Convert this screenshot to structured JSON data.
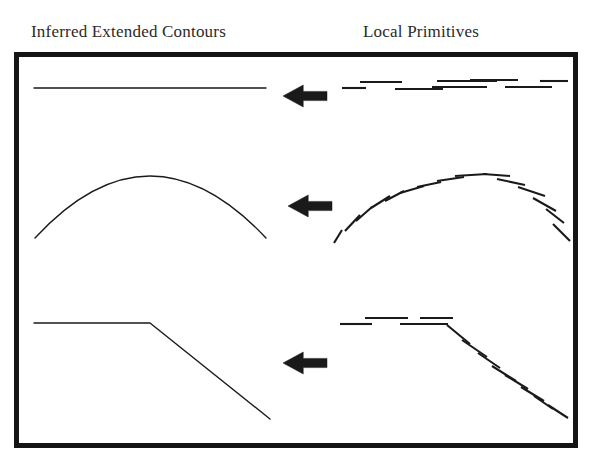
{
  "figure": {
    "title_left": "Inferred Extended Contours",
    "title_right": "Local Primitives",
    "frame_color": "#151515",
    "stroke_color": "#1a1a1a",
    "background": "#ffffff"
  },
  "diagram_data": {
    "type": "diagram",
    "description": "Three rows comparing inferred extended contours (left) with fragmented local primitives (right), joined by leftward arrows",
    "frame": {
      "x": 14,
      "y": 52,
      "width": 564,
      "height": 396,
      "border_width": 5
    },
    "rows": [
      {
        "name": "straight-line",
        "arrow": {
          "x": 283,
          "y": 85,
          "direction": "left",
          "width": 44,
          "height": 22
        },
        "inferred": {
          "kind": "polyline",
          "points": [
            [
              34,
              88
            ],
            [
              266,
              88
            ]
          ]
        },
        "primitives": {
          "kind": "segments",
          "segments": [
            [
              [
                342,
                88
              ],
              [
                366,
                88
              ]
            ],
            [
              [
                360,
                82
              ],
              [
                402,
                82
              ]
            ],
            [
              [
                395,
                89
              ],
              [
                443,
                89
              ]
            ],
            [
              [
                437,
                81
              ],
              [
                497,
                81
              ]
            ],
            [
              [
                432,
                87
              ],
              [
                487,
                87
              ]
            ],
            [
              [
                470,
                80
              ],
              [
                518,
                80
              ]
            ],
            [
              [
                505,
                87
              ],
              [
                552,
                87
              ]
            ],
            [
              [
                540,
                81
              ],
              [
                568,
                81
              ]
            ]
          ]
        }
      },
      {
        "name": "convex-arc",
        "arrow": {
          "x": 288,
          "y": 195,
          "direction": "left",
          "width": 44,
          "height": 22
        },
        "inferred": {
          "kind": "arc",
          "start": [
            35,
            238
          ],
          "peak": [
            150,
            176
          ],
          "end": [
            266,
            238
          ]
        },
        "primitives": {
          "kind": "segments",
          "segments": [
            [
              [
                334,
                243
              ],
              [
                342,
                230
              ]
            ],
            [
              [
                345,
                231
              ],
              [
                360,
                215
              ]
            ],
            [
              [
                356,
                221
              ],
              [
                372,
                207
              ]
            ],
            [
              [
                371,
                208
              ],
              [
                390,
                196
              ]
            ],
            [
              [
                385,
                201
              ],
              [
                404,
                191
              ]
            ],
            [
              [
                400,
                193
              ],
              [
                424,
                186
              ]
            ],
            [
              [
                417,
                187
              ],
              [
                441,
                182
              ]
            ],
            [
              [
                437,
                181
              ],
              [
                464,
                177
              ]
            ],
            [
              [
                455,
                176
              ],
              [
                487,
                174
              ]
            ],
            [
              [
                483,
                174
              ],
              [
                510,
                176
              ]
            ],
            [
              [
                497,
                179
              ],
              [
                525,
                185
              ]
            ],
            [
              [
                518,
                187
              ],
              [
                545,
                196
              ]
            ],
            [
              [
                533,
                198
              ],
              [
                556,
                211
              ]
            ],
            [
              [
                546,
                209
              ],
              [
                564,
                223
              ]
            ],
            [
              [
                553,
                224
              ],
              [
                570,
                241
              ]
            ]
          ]
        }
      },
      {
        "name": "corner-line",
        "arrow": {
          "x": 283,
          "y": 352,
          "direction": "left",
          "width": 44,
          "height": 22
        },
        "inferred": {
          "kind": "polyline",
          "points": [
            [
              34,
              323
            ],
            [
              150,
              323
            ],
            [
              270,
              419
            ]
          ]
        },
        "primitives": {
          "kind": "segments",
          "segments": [
            [
              [
                340,
                324
              ],
              [
                372,
                324
              ]
            ],
            [
              [
                365,
                318
              ],
              [
                408,
                318
              ]
            ],
            [
              [
                400,
                324
              ],
              [
                448,
                324
              ]
            ],
            [
              [
                420,
                318
              ],
              [
                453,
                318
              ]
            ],
            [
              [
                447,
                325
              ],
              [
                470,
                344
              ]
            ],
            [
              [
                462,
                340
              ],
              [
                487,
                357
              ]
            ],
            [
              [
                478,
                353
              ],
              [
                500,
                368
              ]
            ],
            [
              [
                492,
                366
              ],
              [
                516,
                381
              ]
            ],
            [
              [
                505,
                375
              ],
              [
                528,
                389
              ]
            ],
            [
              [
                521,
                387
              ],
              [
                544,
                401
              ]
            ],
            [
              [
                534,
                396
              ],
              [
                553,
                409
              ]
            ],
            [
              [
                548,
                405
              ],
              [
                568,
                418
              ]
            ]
          ]
        }
      }
    ]
  }
}
